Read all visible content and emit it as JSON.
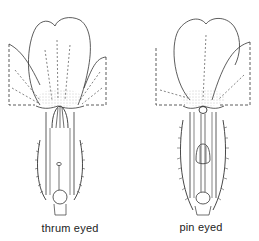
{
  "diagram": {
    "type": "botanical-illustration",
    "colors": {
      "ink": "#333333",
      "background": "#ffffff",
      "stipple": "#888888"
    },
    "flowers": [
      {
        "id": "thrum",
        "label": "thrum eyed",
        "label_pos": {
          "x": 70,
          "y": 222
        },
        "features": [
          "anthers high at corolla mouth",
          "short style",
          "round ovary at base",
          "hairy calyx"
        ]
      },
      {
        "id": "pin",
        "label": "pin eyed",
        "label_pos": {
          "x": 201,
          "y": 221
        },
        "features": [
          "stigma at corolla mouth",
          "long style",
          "anthers low in tube",
          "hairy calyx"
        ]
      }
    ]
  }
}
